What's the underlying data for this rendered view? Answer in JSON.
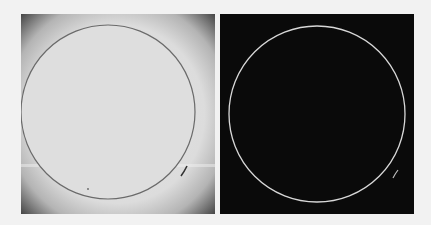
{
  "figure": {
    "panels": [
      {
        "id": "left",
        "description": "grayscale image of circular disc with vignetted dark corners",
        "background": "#d9d9d9",
        "corner_shade": "#4a4a4a",
        "circle": {
          "cx": 87,
          "cy": 98,
          "r": 87,
          "stroke": "#6a6a6a",
          "stroke_width": 1.2
        }
      },
      {
        "id": "right",
        "description": "edge-detected image: thin bright circle outline on black background",
        "background": "#0a0a0a",
        "circle": {
          "cx": 97,
          "cy": 100,
          "r": 88,
          "stroke": "#d8d8d8",
          "stroke_width": 1.3
        }
      }
    ],
    "page_background": "#f2f2f2"
  }
}
